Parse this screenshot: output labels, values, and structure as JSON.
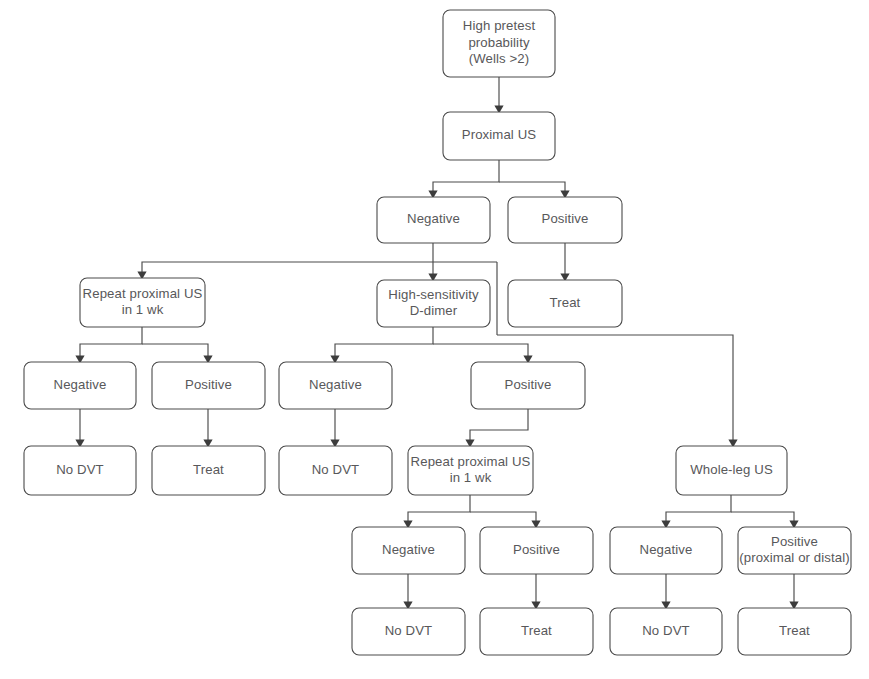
{
  "diagram": {
    "type": "flowchart",
    "background_color": "#ffffff",
    "box_border_color": "#4a4a4a",
    "text_color": "#58585a",
    "edge_color": "#4a4a4a"
  },
  "nodes": [
    {
      "id": "n1",
      "name": "high-pretest-probability",
      "lines": [
        "High pretest",
        "probability",
        "(Wells >2)"
      ],
      "x": 443,
      "y": 10,
      "w": 112,
      "h": 67
    },
    {
      "id": "n2",
      "name": "proximal-us",
      "lines": [
        "Proximal US"
      ],
      "x": 443,
      "y": 112,
      "w": 112,
      "h": 48
    },
    {
      "id": "n3",
      "name": "proximal-us-negative",
      "lines": [
        "Negative"
      ],
      "x": 377,
      "y": 197,
      "w": 113,
      "h": 46
    },
    {
      "id": "n4",
      "name": "proximal-us-positive",
      "lines": [
        "Positive"
      ],
      "x": 508,
      "y": 197,
      "w": 114,
      "h": 46
    },
    {
      "id": "n5",
      "name": "repeat-proximal-us-left",
      "lines": [
        "Repeat proximal US",
        "in 1 wk"
      ],
      "x": 80,
      "y": 278,
      "w": 125,
      "h": 49
    },
    {
      "id": "n6",
      "name": "high-sensitivity-d-dimer",
      "lines": [
        "High-sensitivity",
        "D-dimer"
      ],
      "x": 377,
      "y": 280,
      "w": 113,
      "h": 47
    },
    {
      "id": "n7",
      "name": "treat-from-positive-us",
      "lines": [
        "Treat"
      ],
      "x": 508,
      "y": 280,
      "w": 114,
      "h": 47
    },
    {
      "id": "n8",
      "name": "repeat-us-left-negative",
      "lines": [
        "Negative"
      ],
      "x": 24,
      "y": 362,
      "w": 112,
      "h": 47
    },
    {
      "id": "n9",
      "name": "repeat-us-left-positive",
      "lines": [
        "Positive"
      ],
      "x": 152,
      "y": 362,
      "w": 113,
      "h": 47
    },
    {
      "id": "n10",
      "name": "d-dimer-negative",
      "lines": [
        "Negative"
      ],
      "x": 279,
      "y": 362,
      "w": 113,
      "h": 47
    },
    {
      "id": "n11",
      "name": "d-dimer-positive",
      "lines": [
        "Positive"
      ],
      "x": 471,
      "y": 362,
      "w": 114,
      "h": 47
    },
    {
      "id": "n12",
      "name": "no-dvt-left-1",
      "lines": [
        "No DVT"
      ],
      "x": 24,
      "y": 446,
      "w": 112,
      "h": 49
    },
    {
      "id": "n13",
      "name": "treat-left-1",
      "lines": [
        "Treat"
      ],
      "x": 152,
      "y": 446,
      "w": 113,
      "h": 49
    },
    {
      "id": "n14",
      "name": "no-dvt-d-dimer-negative",
      "lines": [
        "No DVT"
      ],
      "x": 279,
      "y": 446,
      "w": 113,
      "h": 49
    },
    {
      "id": "n15",
      "name": "repeat-proximal-us-middle",
      "lines": [
        "Repeat proximal US",
        "in 1 wk"
      ],
      "x": 408,
      "y": 446,
      "w": 125,
      "h": 49
    },
    {
      "id": "n16",
      "name": "whole-leg-us",
      "lines": [
        "Whole-leg US"
      ],
      "x": 676,
      "y": 446,
      "w": 111,
      "h": 49
    },
    {
      "id": "n17",
      "name": "repeat-us-middle-negative",
      "lines": [
        "Negative"
      ],
      "x": 352,
      "y": 527,
      "w": 113,
      "h": 47
    },
    {
      "id": "n18",
      "name": "repeat-us-middle-positive",
      "lines": [
        "Positive"
      ],
      "x": 480,
      "y": 527,
      "w": 113,
      "h": 47
    },
    {
      "id": "n19",
      "name": "whole-leg-us-negative",
      "lines": [
        "Negative"
      ],
      "x": 610,
      "y": 527,
      "w": 112,
      "h": 47
    },
    {
      "id": "n20",
      "name": "whole-leg-us-positive",
      "lines": [
        "Positive",
        "(proximal or distal)"
      ],
      "x": 738,
      "y": 527,
      "w": 113,
      "h": 47
    },
    {
      "id": "n21",
      "name": "no-dvt-middle",
      "lines": [
        "No DVT"
      ],
      "x": 352,
      "y": 608,
      "w": 113,
      "h": 47
    },
    {
      "id": "n22",
      "name": "treat-middle",
      "lines": [
        "Treat"
      ],
      "x": 480,
      "y": 608,
      "w": 113,
      "h": 47
    },
    {
      "id": "n23",
      "name": "no-dvt-whole-leg",
      "lines": [
        "No DVT"
      ],
      "x": 610,
      "y": 608,
      "w": 112,
      "h": 47
    },
    {
      "id": "n24",
      "name": "treat-whole-leg",
      "lines": [
        "Treat"
      ],
      "x": 738,
      "y": 608,
      "w": 113,
      "h": 47
    }
  ],
  "edges": [
    {
      "name": "edge-pretest-to-proximal-us",
      "points": "499,77 499,106",
      "arrow": "down"
    },
    {
      "name": "edge-proximal-us-split",
      "points": "499,160 499,182 433,182 433,191",
      "arrow": "down"
    },
    {
      "name": "edge-proximal-us-split-right",
      "points": "499,182 565,182 565,191",
      "arrow": "down"
    },
    {
      "name": "edge-negative-to-d-dimer",
      "points": "433,243 433,274",
      "arrow": "down"
    },
    {
      "name": "edge-positive-to-treat",
      "points": "565,243 565,274",
      "arrow": "down"
    },
    {
      "name": "edge-negative-to-repeat-left",
      "points": "497,262 142,262 142,272",
      "arrow": "down"
    },
    {
      "name": "edge-negative-right-down",
      "points": "497,262 497,335",
      "arrow": "none"
    },
    {
      "name": "edge-negative-to-whole-leg",
      "points": "497,335 733,335 733,440",
      "arrow": "down"
    },
    {
      "name": "edge-repeat-left-split",
      "points": "142,327 142,344 80,344 80,356",
      "arrow": "down"
    },
    {
      "name": "edge-repeat-left-split-right",
      "points": "142,344 208,344 208,356",
      "arrow": "down"
    },
    {
      "name": "edge-d-dimer-split",
      "points": "433,327 433,344 335,344 335,356",
      "arrow": "down"
    },
    {
      "name": "edge-d-dimer-split-right",
      "points": "433,344 528,344 528,356",
      "arrow": "down"
    },
    {
      "name": "edge-rl-neg-to-nodvt",
      "points": "80,409 80,440",
      "arrow": "down"
    },
    {
      "name": "edge-rl-pos-to-treat",
      "points": "208,409 208,440",
      "arrow": "down"
    },
    {
      "name": "edge-dd-neg-to-nodvt",
      "points": "335,409 335,440",
      "arrow": "down"
    },
    {
      "name": "edge-dd-pos-to-repeat-middle",
      "points": "528,409 528,430 470,430 470,440",
      "arrow": "down"
    },
    {
      "name": "edge-repeat-middle-split",
      "points": "470,495 470,512 408,512 408,521",
      "arrow": "down"
    },
    {
      "name": "edge-repeat-middle-split-right",
      "points": "470,512 536,512 536,521",
      "arrow": "down"
    },
    {
      "name": "edge-whole-leg-split",
      "points": "731,495 731,512 666,512 666,521",
      "arrow": "down"
    },
    {
      "name": "edge-whole-leg-split-right",
      "points": "731,512 794,512 794,521",
      "arrow": "down"
    },
    {
      "name": "edge-rm-neg-to-nodvt",
      "points": "408,574 408,602",
      "arrow": "down"
    },
    {
      "name": "edge-rm-pos-to-treat",
      "points": "536,574 536,602",
      "arrow": "down"
    },
    {
      "name": "edge-wl-neg-to-nodvt",
      "points": "666,574 666,602",
      "arrow": "down"
    },
    {
      "name": "edge-wl-pos-to-treat",
      "points": "794,574 794,602",
      "arrow": "down"
    }
  ]
}
